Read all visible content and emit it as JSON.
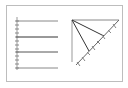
{
  "diagram": {
    "type": "geometry-figure",
    "colors": {
      "line": "#333333",
      "thin": "#777777",
      "frame": "#bdbdbd"
    },
    "left_panel": {
      "description": "four horizontal parallel lines with a tick-marked vertical axis",
      "lines_y": [
        21,
        37,
        52,
        68
      ],
      "line_x_start": 17,
      "line_x_end": 58,
      "axis_ticks": 9
    },
    "right_panel": {
      "description": "right triangle with apex at top-left, two cevians to hypotenuse, tick marks along hypotenuse",
      "apex": [
        72,
        20
      ],
      "top_right": [
        119,
        20
      ],
      "bottom_left": [
        72,
        62
      ],
      "cevian_points": [
        [
          104,
          36
        ],
        [
          89,
          51
        ]
      ],
      "hypotenuse_ticks": 8
    }
  }
}
